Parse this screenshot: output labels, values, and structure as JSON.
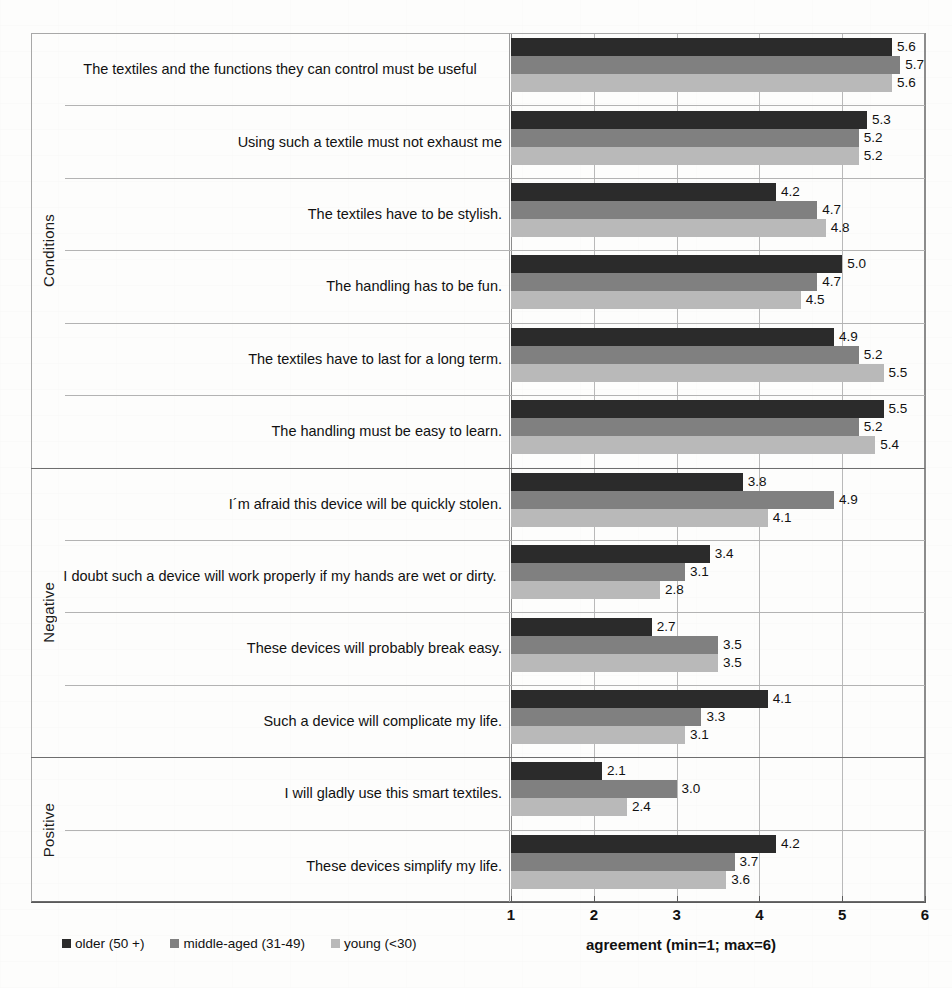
{
  "chart_data": {
    "type": "bar",
    "orientation": "horizontal",
    "title": "",
    "xlabel": "agreement (min=1; max=6)",
    "ylabel": "",
    "xlim": [
      1,
      6
    ],
    "xticks": [
      1,
      2,
      3,
      4,
      5,
      6
    ],
    "grid": true,
    "legend_position": "bottom-left",
    "categories": [
      "The textiles and the functions they can control must be useful",
      "Using such a textile must not exhaust me",
      "The textiles have to be stylish.",
      "The handling has to be fun.",
      "The textiles have to last for a long term.",
      "The handling must be easy to learn.",
      "I´m afraid this device will be quickly stolen.",
      "I doubt such a device will work properly if my hands are wet or dirty.",
      "These devices will probably break easy.",
      "Such a device will complicate my life.",
      "I will gladly use this smart textiles.",
      "These devices simplify my life."
    ],
    "series": [
      {
        "name": "older (50 +)",
        "color": "#2b2b2b",
        "values": [
          5.6,
          5.3,
          4.2,
          5.0,
          4.9,
          5.5,
          3.8,
          3.4,
          2.7,
          4.1,
          2.1,
          4.2
        ],
        "labels": [
          "5.6",
          "5.3",
          "4.2",
          "5.0",
          "4.9",
          "5.5",
          "3.8",
          "3.4",
          "2.7",
          "4.1",
          "2.1",
          "4.2"
        ]
      },
      {
        "name": "middle-aged (31-49)",
        "color": "#808080",
        "values": [
          5.7,
          5.2,
          4.7,
          4.7,
          5.2,
          5.2,
          4.9,
          3.1,
          3.5,
          3.3,
          3.0,
          3.7
        ],
        "labels": [
          "5.7",
          "5.2",
          "4.7",
          "4.7",
          "5.2",
          "5.2",
          "4.9",
          "3.1",
          "3.5",
          "3.3",
          "3.0",
          "3.7"
        ]
      },
      {
        "name": "young (<30)",
        "color": "#b9b9b9",
        "values": [
          5.6,
          5.2,
          4.8,
          4.5,
          5.5,
          5.4,
          4.1,
          2.8,
          3.5,
          3.1,
          2.4,
          3.6
        ],
        "labels": [
          "5.6",
          "5.2",
          "4.8",
          "4.5",
          "5.5",
          "5.4",
          "4.1",
          "2.8",
          "3.5",
          "3.1",
          "2.4",
          "3.6"
        ]
      }
    ],
    "groups": [
      {
        "label": "Conditions",
        "start": 0,
        "end": 5
      },
      {
        "label": "Negative",
        "start": 6,
        "end": 9
      },
      {
        "label": "Positive",
        "start": 10,
        "end": 11
      }
    ]
  },
  "legend": {
    "items": [
      {
        "label": "older (50 +)",
        "color": "#2b2b2b"
      },
      {
        "label": "middle-aged (31-49)",
        "color": "#808080"
      },
      {
        "label": "young (<30)",
        "color": "#b9b9b9"
      }
    ]
  },
  "axis": {
    "x_title": "agreement (min=1; max=6)",
    "x_tick_labels": [
      "1",
      "2",
      "3",
      "4",
      "5",
      "6"
    ]
  }
}
